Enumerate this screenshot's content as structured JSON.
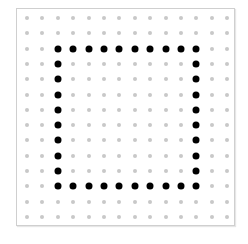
{
  "grid": {
    "rows": 14,
    "cols": 14,
    "origin_x": 27,
    "origin_y": 18,
    "spacing_x": 15.4,
    "spacing_y": 15.3,
    "grid_dot_color": "#c8c8c8",
    "path_dot_color": "#000000"
  },
  "shape": {
    "type": "square-outline",
    "top_row": 3,
    "bottom_row": 12,
    "left_col": 3,
    "right_col": 12
  }
}
